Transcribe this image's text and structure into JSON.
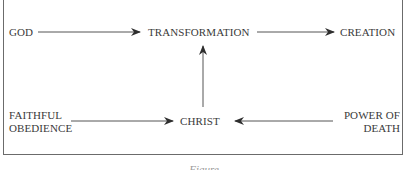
{
  "diagram": {
    "nodes": {
      "god": "GOD",
      "transformation": "TRANSFORMATION",
      "creation": "CREATION",
      "faithful_obedience": [
        "FAITHFUL",
        "OBEDIENCE"
      ],
      "christ": "CHRIST",
      "power_of_death": [
        "POWER OF",
        "DEATH"
      ]
    },
    "edges": [
      {
        "from": "GOD",
        "to": "TRANSFORMATION"
      },
      {
        "from": "TRANSFORMATION",
        "to": "CREATION"
      },
      {
        "from": "CHRIST",
        "to": "TRANSFORMATION"
      },
      {
        "from": "FAITHFUL OBEDIENCE",
        "to": "CHRIST"
      },
      {
        "from": "POWER OF DEATH",
        "to": "CHRIST"
      }
    ],
    "caption": "Figure",
    "colors": {
      "text": "#3a3a3a",
      "line": "#555555",
      "frame": "#6b6b6b"
    }
  }
}
